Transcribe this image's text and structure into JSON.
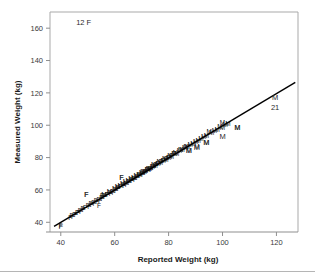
{
  "chart_data": {
    "type": "scatter",
    "title": "",
    "xlabel": "Reported Weight (kg)",
    "ylabel": "Measured Weight (kg)",
    "xlim": [
      36,
      128
    ],
    "ylim": [
      34,
      170
    ],
    "xticks": [
      40,
      60,
      80,
      100,
      120
    ],
    "yticks": [
      40,
      60,
      80,
      100,
      120,
      140,
      160
    ],
    "xtick_labels": [
      "40",
      "60",
      "80",
      "100",
      "120"
    ],
    "ytick_labels": [
      "40",
      "60",
      "80",
      "100",
      "120",
      "140",
      "160"
    ],
    "grid": false,
    "legend": "none",
    "marker_style": "letter-glyph",
    "annotations": [
      {
        "name": "count-f-top-left",
        "text": "12 F",
        "x": 48.5,
        "y": 163.5
      },
      {
        "name": "outlier-label-m-right",
        "text": "M",
        "x": 119.5,
        "y": 117.5
      },
      {
        "name": "count-21-right",
        "text": "21",
        "x": 119.5,
        "y": 111.0
      },
      {
        "name": "outlier-label-m-1",
        "text": "M",
        "x": 105.5,
        "y": 98.5
      },
      {
        "name": "outlier-label-m-2",
        "text": "M",
        "x": 100.0,
        "y": 93.0
      },
      {
        "name": "outlier-label-m-3",
        "text": "M",
        "x": 94.0,
        "y": 89.5
      },
      {
        "name": "outlier-label-m-4",
        "text": "M",
        "x": 90.5,
        "y": 86.5
      },
      {
        "name": "outlier-label-m-5",
        "text": "M",
        "x": 87.5,
        "y": 84.5
      },
      {
        "name": "outlier-label-f-1",
        "text": "F",
        "x": 49.5,
        "y": 57.0
      },
      {
        "name": "outlier-label-f-2",
        "text": "F",
        "x": 62.5,
        "y": 67.5
      },
      {
        "name": "outlier-label-f-bottom",
        "text": "F",
        "x": 40.0,
        "y": 37.5
      }
    ],
    "fit_line": {
      "name": "identity-regression-line",
      "x0": 37.5,
      "y0": 37.5,
      "x1": 127.0,
      "y1": 126.5,
      "slope": 1.0,
      "intercept": 0.0
    },
    "series": [
      {
        "name": "F",
        "label": "Female",
        "glyph": "F",
        "points": [
          [
            40.0,
            37.8
          ],
          [
            43.5,
            43.0
          ],
          [
            44.0,
            44.2
          ],
          [
            44.5,
            43.6
          ],
          [
            45.0,
            45.0
          ],
          [
            45.5,
            44.4
          ],
          [
            46.0,
            46.1
          ],
          [
            46.5,
            45.8
          ],
          [
            47.0,
            47.2
          ],
          [
            47.5,
            46.6
          ],
          [
            48.0,
            48.3
          ],
          [
            48.5,
            47.8
          ],
          [
            49.0,
            49.1
          ],
          [
            49.5,
            57.0
          ],
          [
            50.0,
            50.2
          ],
          [
            50.5,
            49.6
          ],
          [
            51.0,
            51.3
          ],
          [
            51.5,
            50.8
          ],
          [
            52.0,
            52.1
          ],
          [
            52.5,
            51.5
          ],
          [
            53.0,
            53.4
          ],
          [
            53.5,
            52.8
          ],
          [
            54.0,
            54.2
          ],
          [
            54.2,
            50.0
          ],
          [
            54.5,
            53.6
          ],
          [
            55.0,
            55.1
          ],
          [
            55.3,
            56.4
          ],
          [
            55.5,
            54.5
          ],
          [
            56.0,
            56.2
          ],
          [
            56.4,
            55.6
          ],
          [
            57.0,
            57.3
          ],
          [
            57.5,
            56.8
          ],
          [
            58.0,
            58.1
          ],
          [
            58.5,
            57.4
          ],
          [
            59.0,
            59.2
          ],
          [
            59.5,
            58.6
          ],
          [
            60.0,
            60.3
          ],
          [
            60.5,
            59.7
          ],
          [
            61.0,
            61.1
          ],
          [
            61.5,
            60.5
          ],
          [
            62.0,
            62.2
          ],
          [
            62.5,
            67.5
          ],
          [
            63.0,
            63.4
          ],
          [
            63.5,
            62.8
          ],
          [
            64.0,
            64.1
          ],
          [
            64.5,
            63.5
          ],
          [
            65.0,
            65.2
          ],
          [
            65.5,
            64.6
          ],
          [
            66.0,
            66.3
          ],
          [
            66.5,
            65.7
          ],
          [
            67.0,
            67.1
          ],
          [
            67.5,
            66.5
          ],
          [
            68.0,
            68.2
          ],
          [
            68.5,
            67.6
          ],
          [
            69.0,
            69.3
          ],
          [
            69.5,
            68.7
          ],
          [
            70.0,
            70.1
          ],
          [
            70.5,
            69.5
          ],
          [
            71.0,
            71.2
          ],
          [
            71.5,
            70.6
          ],
          [
            72.0,
            72.3
          ],
          [
            72.5,
            71.7
          ],
          [
            73.0,
            73.1
          ],
          [
            73.5,
            72.5
          ],
          [
            74.0,
            74.2
          ],
          [
            74.5,
            73.6
          ],
          [
            75.0,
            75.3
          ],
          [
            75.5,
            74.7
          ],
          [
            76.0,
            76.1
          ],
          [
            77.0,
            77.2
          ],
          [
            78.0,
            78.3
          ],
          [
            79.0,
            79.1
          ],
          [
            80.0,
            80.2
          ],
          [
            81.0,
            81.3
          ],
          [
            82.0,
            82.1
          ]
        ]
      },
      {
        "name": "M",
        "label": "Male",
        "glyph": "M",
        "points": [
          [
            56.0,
            56.8
          ],
          [
            58.0,
            58.9
          ],
          [
            60.0,
            61.0
          ],
          [
            61.0,
            61.8
          ],
          [
            62.0,
            62.9
          ],
          [
            63.0,
            63.7
          ],
          [
            64.0,
            64.8
          ],
          [
            65.0,
            65.6
          ],
          [
            66.0,
            66.9
          ],
          [
            67.0,
            67.5
          ],
          [
            68.0,
            68.8
          ],
          [
            69.0,
            69.4
          ],
          [
            70.0,
            70.7
          ],
          [
            70.5,
            71.5
          ],
          [
            71.0,
            71.3
          ],
          [
            72.0,
            72.6
          ],
          [
            72.5,
            73.4
          ],
          [
            73.0,
            73.2
          ],
          [
            74.0,
            74.5
          ],
          [
            74.5,
            75.3
          ],
          [
            75.0,
            75.1
          ],
          [
            76.0,
            76.4
          ],
          [
            76.5,
            77.2
          ],
          [
            77.0,
            77.0
          ],
          [
            78.0,
            78.3
          ],
          [
            78.5,
            79.1
          ],
          [
            79.0,
            78.9
          ],
          [
            80.0,
            80.2
          ],
          [
            80.5,
            81.0
          ],
          [
            81.0,
            80.8
          ],
          [
            82.0,
            82.1
          ],
          [
            82.5,
            82.9
          ],
          [
            83.0,
            82.7
          ],
          [
            84.0,
            84.0
          ],
          [
            84.5,
            84.8
          ],
          [
            85.0,
            84.6
          ],
          [
            86.0,
            85.9
          ],
          [
            86.5,
            86.7
          ],
          [
            87.0,
            86.5
          ],
          [
            87.5,
            84.5
          ],
          [
            88.0,
            87.8
          ],
          [
            89.0,
            88.6
          ],
          [
            90.0,
            89.9
          ],
          [
            90.5,
            86.5
          ],
          [
            91.0,
            90.7
          ],
          [
            92.0,
            91.5
          ],
          [
            93.0,
            92.8
          ],
          [
            94.0,
            93.6
          ],
          [
            94.0,
            89.5
          ],
          [
            95.0,
            96.2
          ],
          [
            96.0,
            95.4
          ],
          [
            97.0,
            96.7
          ],
          [
            98.0,
            97.5
          ],
          [
            99.0,
            98.8
          ],
          [
            100.0,
            98.5
          ],
          [
            100.0,
            101.6
          ],
          [
            101.0,
            100.4
          ],
          [
            102.0,
            101.2
          ],
          [
            105.5,
            98.5
          ]
        ]
      }
    ]
  },
  "axis": {
    "x_title": "Reported Weight (kg)",
    "y_title": "Measured Weight (kg)"
  },
  "colors": {
    "background": "#ffffff",
    "frame": "#a9a9a9",
    "axis": "#8f8f8f",
    "tick_text": "#3a3a3a",
    "title_text": "#1a1a1a",
    "marker": "#111111",
    "fit_line": "#000000",
    "bottom_rule": "#b5b5b5"
  }
}
